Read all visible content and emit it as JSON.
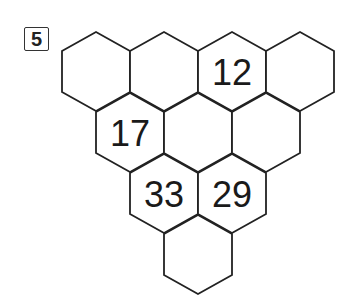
{
  "problem": {
    "number": "5"
  },
  "puzzle": {
    "type": "hexagon-pyramid",
    "stroke_color": "#222222",
    "fill_color": "#ffffff",
    "geometry": {
      "origin_cx": 96,
      "origin_top": 32,
      "hex_width": 68,
      "row_height": 61,
      "shoulder": 19,
      "side": 41
    },
    "rows": [
      [
        "",
        "",
        "12",
        ""
      ],
      [
        "17",
        "",
        ""
      ],
      [
        "33",
        "29"
      ],
      [
        ""
      ]
    ]
  }
}
